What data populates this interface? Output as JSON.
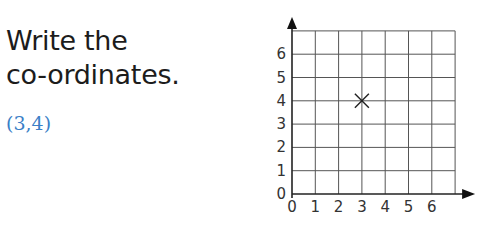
{
  "question": {
    "line1": "Write the",
    "line2": "co-ordinates."
  },
  "answer": "(3,4)",
  "colors": {
    "answer": "#3a7fc7",
    "text": "#1c1c1c"
  },
  "chart_data": {
    "type": "scatter",
    "title": "",
    "xlabel": "",
    "ylabel": "",
    "x_ticks": [
      "0",
      "1",
      "2",
      "3",
      "4",
      "5",
      "6"
    ],
    "y_ticks": [
      "0",
      "1",
      "2",
      "3",
      "4",
      "5",
      "6"
    ],
    "xlim": [
      0,
      7
    ],
    "ylim": [
      0,
      7
    ],
    "grid": true,
    "points": [
      {
        "x": 3,
        "y": 4,
        "marker": "x"
      }
    ]
  }
}
